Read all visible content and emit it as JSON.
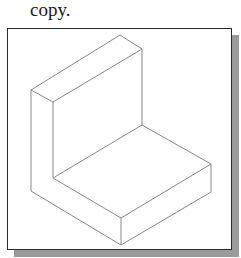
{
  "caption": {
    "text": "copy."
  },
  "figure": {
    "line_color": "#8a8a8a",
    "frame_color": "#2a2a2a",
    "shadow_color": "#9a9a9a"
  }
}
